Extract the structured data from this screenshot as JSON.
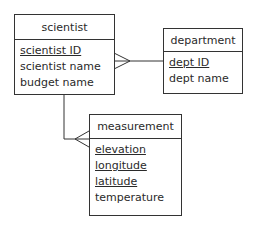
{
  "diagram": {
    "type": "entity-relationship",
    "entities": [
      {
        "name": "scientist",
        "attributes": [
          {
            "label": "scientist ID",
            "primary_key": true
          },
          {
            "label": "scientist name",
            "primary_key": false
          },
          {
            "label": "budget name",
            "primary_key": false
          }
        ]
      },
      {
        "name": "department",
        "attributes": [
          {
            "label": "dept ID",
            "primary_key": true
          },
          {
            "label": "dept name",
            "primary_key": false
          }
        ]
      },
      {
        "name": "measurement",
        "attributes": [
          {
            "label": "elevation",
            "primary_key": true
          },
          {
            "label": "longitude",
            "primary_key": true
          },
          {
            "label": "latitude",
            "primary_key": true
          },
          {
            "label": "temperature",
            "primary_key": false
          }
        ]
      }
    ],
    "relationships": [
      {
        "from": "department",
        "to": "scientist",
        "many_end": "scientist"
      },
      {
        "from": "scientist",
        "to": "measurement",
        "many_end": "measurement"
      }
    ],
    "colors": {
      "line": "#333333",
      "text": "#2a2a2a",
      "background": "#ffffff"
    }
  }
}
